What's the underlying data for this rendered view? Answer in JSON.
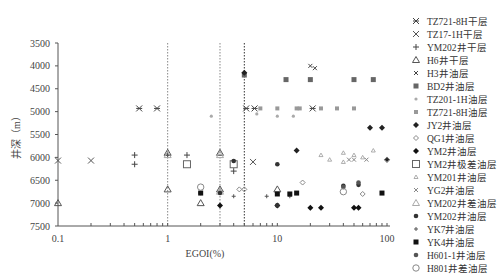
{
  "chart_data": {
    "type": "scatter",
    "title": "",
    "xlabel": "EGOI(%)",
    "ylabel": "井深（m）",
    "xscale": "log",
    "xlim": [
      0.1,
      100
    ],
    "ylim": [
      3500,
      7500
    ],
    "y_inverted": true,
    "x_ticks": [
      "0.1",
      "1",
      "10",
      "100"
    ],
    "y_ticks": [
      "3500",
      "4000",
      "4500",
      "5000",
      "5500",
      "6000",
      "6500",
      "7000",
      "7500"
    ],
    "grid": false,
    "legend_position": "right",
    "reference_lines": [
      {
        "x": 1,
        "style": "dotted",
        "color": "#888888"
      },
      {
        "x": 3,
        "style": "dotted",
        "color": "#888888"
      },
      {
        "x": 5,
        "style": "dotted",
        "color": "#333333"
      }
    ],
    "series": [
      {
        "name": "TZ721-8H干层",
        "marker": "asterisk",
        "color": "#444444",
        "points": [
          [
            0.55,
            4930
          ],
          [
            0.8,
            4930
          ],
          [
            5.2,
            4930
          ],
          [
            6.2,
            4930
          ],
          [
            21,
            4930
          ]
        ]
      },
      {
        "name": "TZ17-1H干层",
        "marker": "x",
        "color": "#555555",
        "points": [
          [
            0.1,
            6070
          ],
          [
            0.2,
            6070
          ],
          [
            6.0,
            6100
          ]
        ]
      },
      {
        "name": "YM202井干层",
        "marker": "plus",
        "color": "#444444",
        "points": [
          [
            0.5,
            5950
          ],
          [
            0.5,
            6150
          ],
          [
            1.0,
            5950
          ],
          [
            1.5,
            5950
          ],
          [
            4.0,
            6300
          ]
        ]
      },
      {
        "name": "H6井干层",
        "marker": "triangle-open",
        "color": "#555555",
        "points": [
          [
            0.1,
            7000
          ],
          [
            1.0,
            5900
          ],
          [
            1.0,
            6700
          ],
          [
            2.0,
            7000
          ],
          [
            3.0,
            5900
          ],
          [
            3.0,
            6700
          ],
          [
            10,
            6700
          ]
        ]
      },
      {
        "name": "H3井油层",
        "marker": "x-small",
        "color": "#444444",
        "points": [
          [
            20,
            4000
          ],
          [
            22,
            4050
          ]
        ]
      },
      {
        "name": "BD2井油层",
        "marker": "square",
        "color": "#666666",
        "points": [
          [
            5.0,
            4200
          ],
          [
            12,
            4300
          ],
          [
            20,
            4300
          ],
          [
            50,
            4300
          ],
          [
            75,
            4300
          ]
        ]
      },
      {
        "name": "TZ201-1H油层",
        "marker": "dot-small",
        "color": "#aaaaaa",
        "points": [
          [
            2.5,
            5100
          ],
          [
            6.5,
            5050
          ],
          [
            10,
            5100
          ],
          [
            14,
            5100
          ],
          [
            3.0,
            6700
          ]
        ]
      },
      {
        "name": "TZ721-8H油层",
        "marker": "square-small",
        "color": "#999999",
        "points": [
          [
            7.0,
            4930
          ],
          [
            10,
            4930
          ],
          [
            15,
            4930
          ],
          [
            16,
            4930
          ],
          [
            25,
            4930
          ],
          [
            35,
            4930
          ],
          [
            50,
            4930
          ]
        ]
      },
      {
        "name": "JY2井油层",
        "marker": "diamond-filled",
        "color": "#222222",
        "points": [
          [
            5.0,
            4150
          ],
          [
            70,
            5350
          ],
          [
            90,
            5350
          ],
          [
            100,
            6050
          ],
          [
            15,
            5850
          ]
        ]
      },
      {
        "name": "QG1井油层",
        "marker": "diamond-open",
        "color": "#888888",
        "points": [
          [
            4.5,
            6700
          ],
          [
            5.0,
            6700
          ],
          [
            17,
            6550
          ],
          [
            60,
            6800
          ],
          [
            100,
            6050
          ]
        ]
      },
      {
        "name": "YM2井油层",
        "marker": "diamond-filled",
        "color": "#111111",
        "points": [
          [
            3.0,
            7050
          ],
          [
            10,
            7050
          ],
          [
            20,
            7100
          ],
          [
            25,
            7100
          ],
          [
            50,
            7100
          ],
          [
            55,
            7100
          ]
        ]
      },
      {
        "name": "YM2井极差油层",
        "marker": "square-open",
        "color": "#666666",
        "points": [
          [
            1.5,
            6150
          ],
          [
            4.0,
            6150
          ]
        ]
      },
      {
        "name": "YM201井油层",
        "marker": "triangle-small",
        "color": "#999999",
        "points": [
          [
            25,
            5950
          ],
          [
            30,
            6050
          ],
          [
            40,
            5900
          ],
          [
            40,
            6100
          ],
          [
            50,
            5950
          ],
          [
            60,
            6000
          ],
          [
            75,
            5850
          ]
        ]
      },
      {
        "name": "YG2井油层",
        "marker": "x-small",
        "color": "#888888",
        "points": [
          [
            45,
            6050
          ],
          [
            50,
            6050
          ],
          [
            65,
            6050
          ]
        ]
      },
      {
        "name": "YM202井差油层",
        "marker": "triangle-open",
        "color": "#aaaaaa",
        "points": [
          [
            1.0,
            5950
          ],
          [
            3.0,
            5950
          ],
          [
            3.0,
            6750
          ]
        ]
      },
      {
        "name": "YM202井油层",
        "marker": "dot",
        "color": "#333333",
        "points": [
          [
            2.0,
            6780
          ],
          [
            3.0,
            6780
          ],
          [
            4.0,
            6080
          ],
          [
            10,
            6150
          ],
          [
            10,
            7050
          ],
          [
            40,
            6620
          ],
          [
            55,
            6600
          ]
        ]
      },
      {
        "name": "YK7井油层",
        "marker": "plus-small",
        "color": "#555555",
        "points": [
          [
            4.0,
            6850
          ],
          [
            8.0,
            6850
          ],
          [
            13,
            6850
          ]
        ]
      },
      {
        "name": "YK4井油层",
        "marker": "square",
        "color": "#111111",
        "points": [
          [
            2.0,
            6780
          ],
          [
            10,
            6800
          ],
          [
            13,
            6800
          ],
          [
            15,
            6780
          ],
          [
            90,
            6780
          ]
        ]
      },
      {
        "name": "H601-1井油层",
        "marker": "dot",
        "color": "#555555",
        "points": [
          [
            40,
            6650
          ],
          [
            55,
            6550
          ]
        ]
      },
      {
        "name": "H801井差油层",
        "marker": "circle-open",
        "color": "#888888",
        "points": [
          [
            2.0,
            6650
          ],
          [
            40,
            6750
          ]
        ]
      }
    ]
  },
  "legend": [
    {
      "label": "TZ721-8H干层",
      "marker": "asterisk",
      "color": "#444444"
    },
    {
      "label": "TZ17-1H干层",
      "marker": "x",
      "color": "#555555"
    },
    {
      "label": "YM202井干层",
      "marker": "plus",
      "color": "#444444"
    },
    {
      "label": "H6井干层",
      "marker": "triangle-open",
      "color": "#555555"
    },
    {
      "label": "H3井油层",
      "marker": "x-small",
      "color": "#444444"
    },
    {
      "label": "BD2井油层",
      "marker": "square",
      "color": "#666666"
    },
    {
      "label": "TZ201-1H油层",
      "marker": "dot-small",
      "color": "#aaaaaa"
    },
    {
      "label": "TZ721-8H油层",
      "marker": "square-small",
      "color": "#999999"
    },
    {
      "label": "JY2井油层",
      "marker": "diamond-filled",
      "color": "#222222"
    },
    {
      "label": "QG1井油层",
      "marker": "diamond-open",
      "color": "#888888"
    },
    {
      "label": "YM2井油层",
      "marker": "diamond-filled",
      "color": "#111111"
    },
    {
      "label": "YM2井极差油层",
      "marker": "square-open",
      "color": "#666666"
    },
    {
      "label": "YM201井油层",
      "marker": "triangle-small",
      "color": "#999999"
    },
    {
      "label": "YG2井油层",
      "marker": "x-small",
      "color": "#888888"
    },
    {
      "label": "YM202井差油层",
      "marker": "triangle-open",
      "color": "#aaaaaa"
    },
    {
      "label": "YM202井油层",
      "marker": "dot",
      "color": "#333333"
    },
    {
      "label": "YK7井油层",
      "marker": "plus-small",
      "color": "#555555"
    },
    {
      "label": "YK4井油层",
      "marker": "square",
      "color": "#111111"
    },
    {
      "label": "H601-1井油层",
      "marker": "dot",
      "color": "#555555"
    },
    {
      "label": "H801井差油层",
      "marker": "circle-open",
      "color": "#888888"
    }
  ]
}
